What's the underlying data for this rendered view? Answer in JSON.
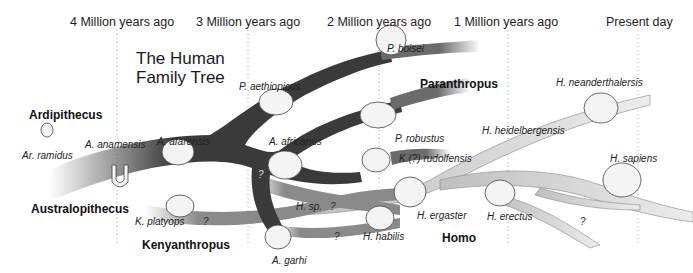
{
  "title": {
    "line1": "The Human",
    "line2": "Family Tree"
  },
  "timeline": [
    {
      "label": "4 Million years ago",
      "x": 115
    },
    {
      "label": "3 Million years ago",
      "x": 246
    },
    {
      "label": "2 Million years ago",
      "x": 377
    },
    {
      "label": "1 Million years ago",
      "x": 508
    },
    {
      "label": "Present day",
      "x": 638
    }
  ],
  "genera": {
    "ardipithecus": "Ardipithecus",
    "australopithecus": "Australopithecus",
    "paranthropus": "Paranthropus",
    "kenyanthropus": "Kenyanthropus",
    "homo": "Homo"
  },
  "species": {
    "ar_ramidus": "Ar. ramidus",
    "a_anamensis": "A. anamensis",
    "a_afarensis": "A. afarensis",
    "a_africanus": "A. africanus",
    "a_garhi": "A. garhi",
    "p_aethiopicus": "P. aethiopicus",
    "p_boisei": "P. boisei",
    "p_robustus": "P. robustus",
    "k_platyops": "K. platyops",
    "k_rudolfensis": "K.(?) rudolfensis",
    "h_sp": "H. sp.",
    "h_habilis": "H. habilis",
    "h_ergaster": "H. ergaster",
    "h_erectus": "H. erectus",
    "h_heidelbergensis": "H. heidelbergensis",
    "h_neanderthalensis": "H. neanderthalersis",
    "h_sapiens": "H. sapiens"
  },
  "unknown_marker": "?",
  "colors": {
    "australopithecus": "#3a3a3a",
    "paranthropus": "#6b6b6b",
    "kenyanthropus": "#8a8a8a",
    "homo": "#dcdcdc"
  }
}
